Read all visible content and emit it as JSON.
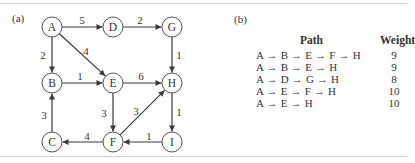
{
  "figure": {
    "panel_a_label": "(a)",
    "panel_b_label": "(b)"
  },
  "graph": {
    "nodes": [
      {
        "id": "A",
        "x": 52,
        "y": 27
      },
      {
        "id": "D",
        "x": 113,
        "y": 27
      },
      {
        "id": "G",
        "x": 172,
        "y": 27
      },
      {
        "id": "B",
        "x": 52,
        "y": 83
      },
      {
        "id": "E",
        "x": 113,
        "y": 83
      },
      {
        "id": "H",
        "x": 172,
        "y": 83
      },
      {
        "id": "C",
        "x": 52,
        "y": 142
      },
      {
        "id": "F",
        "x": 113,
        "y": 142
      },
      {
        "id": "I",
        "x": 172,
        "y": 142
      }
    ],
    "edges": [
      {
        "from": "A",
        "to": "D",
        "weight": "5"
      },
      {
        "from": "D",
        "to": "G",
        "weight": "2"
      },
      {
        "from": "A",
        "to": "B",
        "weight": "2"
      },
      {
        "from": "A",
        "to": "E",
        "weight": "4"
      },
      {
        "from": "G",
        "to": "H",
        "weight": "1"
      },
      {
        "from": "B",
        "to": "E",
        "weight": "1"
      },
      {
        "from": "E",
        "to": "H",
        "weight": "6"
      },
      {
        "from": "E",
        "to": "F",
        "weight": "3"
      },
      {
        "from": "F",
        "to": "H",
        "weight": "3"
      },
      {
        "from": "H",
        "to": "I",
        "weight": "1"
      },
      {
        "from": "C",
        "to": "B",
        "weight": "3"
      },
      {
        "from": "F",
        "to": "C",
        "weight": "4"
      },
      {
        "from": "I",
        "to": "F",
        "weight": "1"
      }
    ]
  },
  "paths_table": {
    "headers": {
      "path": "Path",
      "weight": "Weight"
    },
    "rows": [
      {
        "path": "A → B → E → F → H",
        "weight": "9"
      },
      {
        "path": "A → B → E → H",
        "weight": "9"
      },
      {
        "path": "A → D → G → H",
        "weight": "8"
      },
      {
        "path": "A → E → F → H",
        "weight": "10"
      },
      {
        "path": "A → E → H",
        "weight": "10"
      }
    ]
  }
}
